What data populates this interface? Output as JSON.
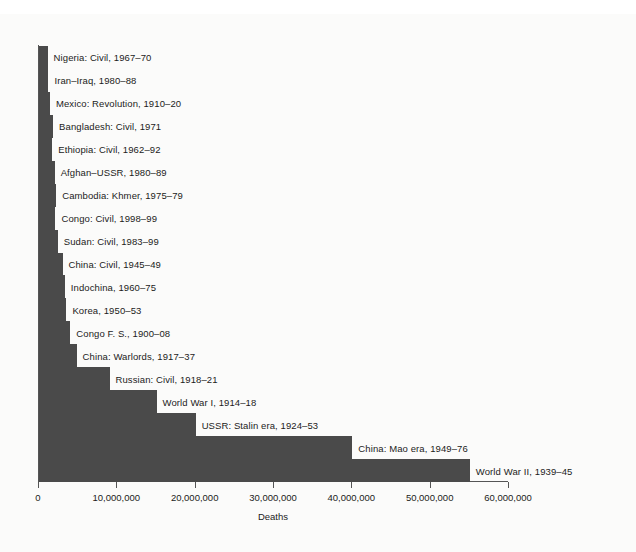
{
  "chart_data": {
    "type": "bar",
    "orientation": "horizontal",
    "title": "",
    "xlabel": "Deaths",
    "ylabel": "",
    "xlim": [
      0,
      60000000
    ],
    "xticks": [
      0,
      10000000,
      20000000,
      30000000,
      40000000,
      50000000,
      60000000
    ],
    "xtick_labels": [
      "0",
      "10,000,000",
      "20,000,000",
      "30,000,000",
      "40,000,000",
      "50,000,000",
      "60,000,000"
    ],
    "grid": false,
    "legend": null,
    "bar_color": "#4a4a4a",
    "categories": [
      "Nigeria: Civil, 1967–70",
      "Iran–Iraq, 1980–88",
      "Mexico: Revolution, 1910–20",
      "Bangladesh: Civil, 1971",
      "Ethiopia: Civil, 1962–92",
      "Afghan–USSR, 1980–89",
      "Cambodia: Khmer, 1975–79",
      "Congo: Civil, 1998–99",
      "Sudan: Civil, 1983–99",
      "China: Civil, 1945–49",
      "Indochina, 1960–75",
      "Korea, 1950–53",
      "Congo F. S., 1900–08",
      "China: Warlords, 1917–37",
      "Russian: Civil, 1918–21",
      "World War I, 1914–18",
      "USSR: Stalin era, 1924–53",
      "China: Mao era, 1949–76",
      "World War II, 1939–45"
    ],
    "values": [
      1100000,
      1200000,
      1400000,
      1800000,
      1700000,
      2000000,
      2200000,
      2100000,
      2400000,
      3000000,
      3300000,
      3500000,
      4000000,
      4800000,
      9000000,
      15000000,
      20000000,
      40000000,
      55000000
    ]
  },
  "bars": [
    {
      "label": "Nigeria: Civil, 1967–70",
      "value": 1100000
    },
    {
      "label": "Iran–Iraq, 1980–88",
      "value": 1200000
    },
    {
      "label": "Mexico: Revolution, 1910–20",
      "value": 1400000
    },
    {
      "label": "Bangladesh: Civil, 1971",
      "value": 1800000
    },
    {
      "label": "Ethiopia: Civil, 1962–92",
      "value": 1700000
    },
    {
      "label": "Afghan–USSR, 1980–89",
      "value": 2000000
    },
    {
      "label": "Cambodia: Khmer, 1975–79",
      "value": 2200000
    },
    {
      "label": "Congo: Civil, 1998–99",
      "value": 2100000
    },
    {
      "label": "Sudan: Civil, 1983–99",
      "value": 2400000
    },
    {
      "label": "China: Civil, 1945–49",
      "value": 3000000
    },
    {
      "label": "Indochina, 1960–75",
      "value": 3300000
    },
    {
      "label": "Korea, 1950–53",
      "value": 3500000
    },
    {
      "label": "Congo F. S., 1900–08",
      "value": 4000000
    },
    {
      "label": "China: Warlords, 1917–37",
      "value": 4800000
    },
    {
      "label": "Russian: Civil, 1918–21",
      "value": 9000000
    },
    {
      "label": "World War I, 1914–18",
      "value": 15000000
    },
    {
      "label": "USSR: Stalin era, 1924–53",
      "value": 20000000
    },
    {
      "label": "China: Mao era, 1949–76",
      "value": 40000000
    },
    {
      "label": "World War II, 1939–45",
      "value": 55000000
    }
  ],
  "axis": {
    "x_title": "Deaths",
    "ticks": [
      {
        "value": 0,
        "label": "0"
      },
      {
        "value": 10000000,
        "label": "10,000,000"
      },
      {
        "value": 20000000,
        "label": "20,000,000"
      },
      {
        "value": 30000000,
        "label": "30,000,000"
      },
      {
        "value": 40000000,
        "label": "40,000,000"
      },
      {
        "value": 50000000,
        "label": "50,000,000"
      },
      {
        "value": 60000000,
        "label": "60,000,000"
      }
    ]
  }
}
